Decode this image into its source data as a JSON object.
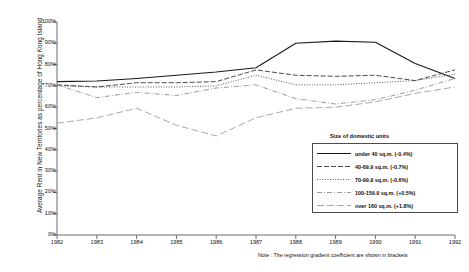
{
  "chart_data": {
    "type": "line",
    "title": "",
    "xlabel": "",
    "ylabel": "Average Rent in New Territories as percentage of Hong Kong Island",
    "x": [
      1982,
      1983,
      1984,
      1985,
      1986,
      1987,
      1988,
      1989,
      1990,
      1991,
      1992
    ],
    "xtick_labels": [
      "1982",
      "1983",
      "1984",
      "1985",
      "1986",
      "1987",
      "1988",
      "1989",
      "1990",
      "1991",
      "1992"
    ],
    "ytick_labels": [
      "0%",
      "10%",
      "20%",
      "30%",
      "40%",
      "50%",
      "60%",
      "70%",
      "80%",
      "90%",
      "100%"
    ],
    "ytick_values": [
      0,
      10,
      20,
      30,
      40,
      50,
      60,
      70,
      80,
      90,
      100
    ],
    "ylim": [
      0,
      100
    ],
    "xlim": [
      1982,
      1992
    ],
    "grid": false,
    "legend_position": "bottom-right",
    "legend_title": "Size of domestic units",
    "note": "Note : The regression gradient coefficient are shown in brackets",
    "series": [
      {
        "name": "under 40 sq.m. (-0.4%)",
        "label": "under 40 sq.m.",
        "coefficient": "-0.4%",
        "style": "solid",
        "color": "#1a1a1a",
        "values": [
          72.0,
          72.3,
          73.5,
          75.0,
          76.5,
          78.5,
          90.0,
          91.0,
          90.5,
          80.5,
          73.5
        ]
      },
      {
        "name": "40-69.9 sq.m. (-0.7%)",
        "label": "40-69.9 sq.m.",
        "coefficient": "-0.7%",
        "style": "dashed",
        "color": "#2b2b2b",
        "values": [
          70.5,
          69.5,
          71.5,
          71.5,
          72.0,
          77.5,
          75.0,
          74.5,
          75.0,
          72.5,
          77.5
        ]
      },
      {
        "name": "70-99.9 sq.m. (-0.6%)",
        "label": "70-99.9 sq.m.",
        "coefficient": "-0.6%",
        "style": "dotted",
        "color": "#3a3a3a",
        "values": [
          70.0,
          69.5,
          69.5,
          69.5,
          70.0,
          75.0,
          70.5,
          70.5,
          71.5,
          72.5,
          75.5
        ]
      },
      {
        "name": "100-159.9 sq.m. (+0.5%)",
        "label": "100-159.9 sq.m.",
        "coefficient": "+0.5%",
        "style": "dashdot",
        "color": "#8a8a8a",
        "values": [
          70.5,
          64.5,
          67.0,
          65.5,
          69.0,
          70.5,
          64.0,
          61.5,
          63.5,
          68.0,
          73.5
        ]
      },
      {
        "name": "over 160 sq.m. (+1.8%)",
        "label": "over 160 sq.m.",
        "coefficient": "+1.8%",
        "style": "longdash",
        "color": "#9a9a9a",
        "values": [
          52.5,
          55.0,
          59.5,
          51.5,
          46.5,
          55.0,
          59.5,
          60.0,
          62.5,
          66.5,
          69.5
        ]
      }
    ]
  }
}
